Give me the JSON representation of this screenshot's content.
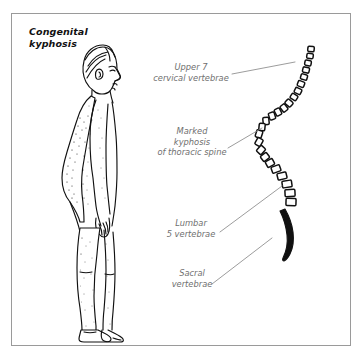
{
  "figure": {
    "title": "Congenital\nkyphosis",
    "border_color": "#9a9a9a",
    "background_color": "#ffffff",
    "ink_color": "#111111",
    "label_color": "#6f6f6f",
    "leader_color": "#8a8a8a"
  },
  "labels": {
    "cervical": "Upper 7\ncervical vertebrae",
    "thoracic": "Marked\nkyphosis\nof thoracic spine",
    "lumbar": "Lumbar\n5 vertebrae",
    "sacral": "Sacral\nvertebrae"
  },
  "illustration": {
    "subject": "lateral-view-human-figure",
    "condition": "congenital kyphosis",
    "spine_regions": [
      {
        "name": "cervical",
        "vertebrae_count": 7,
        "shape": "small-rounded-square"
      },
      {
        "name": "thoracic",
        "vertebrae_count": 12,
        "shape": "rotated-rounded-square"
      },
      {
        "name": "lumbar",
        "vertebrae_count": 5,
        "shape": "large-rectangle"
      },
      {
        "name": "sacral",
        "vertebrae_count": 1,
        "shape": "solid-tapered-curve"
      }
    ]
  }
}
